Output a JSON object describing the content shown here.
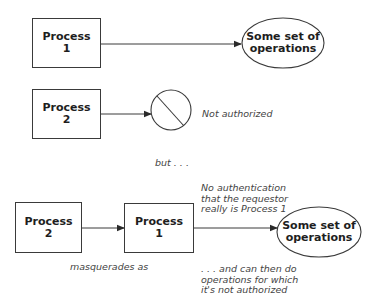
{
  "diagram": {
    "top_row": {
      "process": {
        "line1": "Process",
        "line2": "1"
      },
      "target": {
        "line1": "Some set of",
        "line2": "operations"
      }
    },
    "middle_row": {
      "process": {
        "line1": "Process",
        "line2": "2"
      },
      "blocked_icon": "prohibited-circle-icon",
      "label": "Not authorized"
    },
    "separator": "but . . .",
    "bottom_row": {
      "impostor": {
        "line1": "Process",
        "line2": "2"
      },
      "masked_as": {
        "line1": "Process",
        "line2": "1"
      },
      "target": {
        "line1": "Some set of",
        "line2": "operations"
      },
      "masquerade_label": "masquerades as",
      "auth_note": [
        "No authentication",
        "that the requestor",
        "really is Process 1"
      ],
      "result_note": [
        ". . . and can then do",
        "operations for which",
        "it's not authorized"
      ]
    },
    "colors": {
      "stroke": "#3a3a3a",
      "text": "#1e1e1e",
      "note_text": "#444444",
      "background": "#ffffff"
    }
  }
}
